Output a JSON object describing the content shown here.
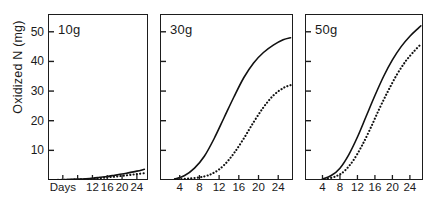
{
  "figure": {
    "ylabel": "Oxidized N (mg)",
    "y_ticks": [
      {
        "value": 50,
        "label": "50"
      },
      {
        "value": 40,
        "label": "40"
      },
      {
        "value": 30,
        "label": "30"
      },
      {
        "value": 20,
        "label": "20"
      },
      {
        "value": 10,
        "label": "10"
      }
    ],
    "ylim": [
      0,
      56
    ],
    "xlim": [
      0,
      27
    ],
    "x_axis_name": "Days"
  },
  "chart_data": {
    "type": "line",
    "title": "",
    "xlabel": "Days",
    "ylabel": "Oxidized N (mg)",
    "xlim": [
      0,
      27
    ],
    "ylim": [
      0,
      56
    ],
    "grid": false,
    "legend": "none",
    "panels": [
      {
        "label": "10g",
        "x_tick_labels": [
          "Days",
          "",
          "12",
          "16",
          "20",
          "24"
        ],
        "x_tick_values": [
          4,
          8,
          12,
          16,
          20,
          24
        ],
        "series": [
          {
            "name": "solid",
            "style": "solid",
            "x": [
              0,
              4,
              8,
              12,
              14,
              16,
              18,
              20,
              22,
              24,
              26
            ],
            "values": [
              0,
              0.1,
              0.3,
              0.6,
              0.9,
              1.2,
              1.6,
              2.0,
              2.5,
              3.0,
              3.6
            ]
          },
          {
            "name": "dotted",
            "style": "dotted",
            "x": [
              0,
              4,
              8,
              12,
              14,
              16,
              18,
              20,
              22,
              24,
              26
            ],
            "values": [
              0,
              0.05,
              0.15,
              0.4,
              0.6,
              0.9,
              1.1,
              1.4,
              1.7,
              2.0,
              2.3
            ]
          }
        ]
      },
      {
        "label": "30g",
        "x_tick_labels": [
          "4",
          "8",
          "12",
          "16",
          "20",
          "24"
        ],
        "x_tick_values": [
          4,
          8,
          12,
          16,
          20,
          24
        ],
        "series": [
          {
            "name": "solid",
            "style": "solid",
            "x": [
              3,
              5,
              7,
              9,
              11,
              13,
              15,
              17,
              19,
              21,
              23,
              25,
              26.5
            ],
            "values": [
              0.3,
              1.5,
              4.0,
              8.0,
              14.0,
              21.0,
              28.0,
              34.5,
              39.5,
              43.0,
              45.5,
              47.3,
              48.0
            ]
          },
          {
            "name": "dotted",
            "style": "dotted",
            "x": [
              3,
              6,
              9,
              11,
              13,
              15,
              17,
              19,
              21,
              23,
              25,
              26.5
            ],
            "values": [
              0.2,
              0.5,
              1.2,
              2.5,
              5.0,
              9.0,
              14.0,
              19.5,
              24.5,
              28.5,
              31.0,
              32.0
            ]
          }
        ]
      },
      {
        "label": "50g",
        "x_tick_labels": [
          "4",
          "8",
          "12",
          "16",
          "20",
          "24"
        ],
        "x_tick_values": [
          4,
          8,
          12,
          16,
          20,
          24
        ],
        "series": [
          {
            "name": "solid",
            "style": "solid",
            "x": [
              4,
              6,
              8,
              10,
              12,
              14,
              16,
              18,
              20,
              22,
              24,
              26,
              26.5
            ],
            "values": [
              0.3,
              1.5,
              4.0,
              8.5,
              14.5,
              21.5,
              28.5,
              35.0,
              40.5,
              45.0,
              48.5,
              51.3,
              52.0
            ]
          },
          {
            "name": "dotted",
            "style": "dotted",
            "x": [
              4.5,
              7,
              9,
              11,
              13,
              15,
              17,
              19,
              21,
              23,
              25,
              26.5
            ],
            "values": [
              0.2,
              1.2,
              3.0,
              6.5,
              11.5,
              17.5,
              24.0,
              30.0,
              35.5,
              40.0,
              43.5,
              45.8
            ]
          }
        ]
      }
    ]
  },
  "colors": {
    "axis": "#1d1d1d",
    "line": "#111111",
    "background": "#ffffff"
  }
}
